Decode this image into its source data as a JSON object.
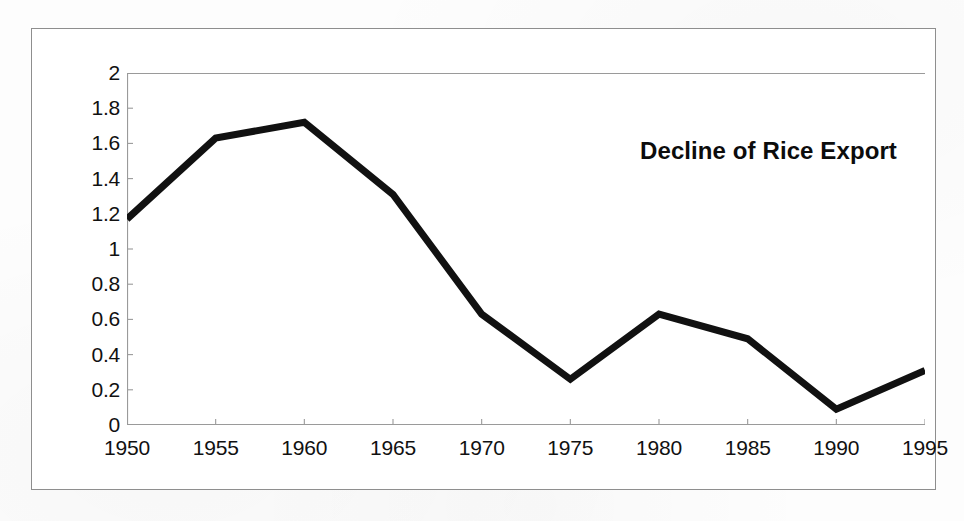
{
  "document": {
    "kind": "scanned-chart-figure",
    "background_color": "#fdfdfd",
    "frame_color": "#8e8e8e"
  },
  "chart_data": {
    "type": "line",
    "title": "Decline of Rice Export",
    "xlabel": "",
    "ylabel": "",
    "x": [
      1950,
      1955,
      1960,
      1965,
      1970,
      1975,
      1980,
      1985,
      1990,
      1995
    ],
    "categories": [
      "1950",
      "1955",
      "1960",
      "1965",
      "1970",
      "1975",
      "1980",
      "1985",
      "1990",
      "1995"
    ],
    "values": [
      1.17,
      1.63,
      1.72,
      1.31,
      0.63,
      0.26,
      0.63,
      0.49,
      0.09,
      0.31
    ],
    "series": [
      {
        "name": "Rice Export",
        "values": [
          1.17,
          1.63,
          1.72,
          1.31,
          0.63,
          0.26,
          0.63,
          0.49,
          0.09,
          0.31
        ],
        "color": "#111111",
        "line_width": 7
      }
    ],
    "ylim": [
      0,
      2
    ],
    "xlim": [
      1950,
      1995
    ],
    "ytick_values": [
      0,
      0.2,
      0.4,
      0.6,
      0.8,
      1,
      1.2,
      1.4,
      1.6,
      1.8,
      2
    ],
    "ytick_labels": [
      "0",
      "0.2",
      "0.4",
      "0.6",
      "0.8",
      "1",
      "1.2",
      "1.4",
      "1.6",
      "1.8",
      "2"
    ],
    "xtick_values": [
      1950,
      1955,
      1960,
      1965,
      1970,
      1975,
      1980,
      1985,
      1990,
      1995
    ],
    "xtick_labels": [
      "1950",
      "1955",
      "1960",
      "1965",
      "1970",
      "1975",
      "1980",
      "1985",
      "1990",
      "1995"
    ],
    "grid": false,
    "legend": null,
    "legend_position": "none",
    "title_position": "inside-top-right",
    "axis_color": "#9a9a9a",
    "annotations": []
  }
}
